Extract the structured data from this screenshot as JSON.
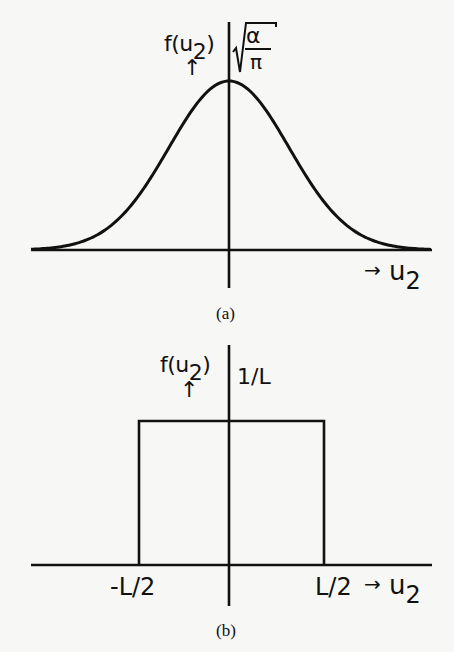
{
  "figure": {
    "panel_a": {
      "caption": "(a)",
      "y_label_fn": "f(u",
      "y_label_sub": "2",
      "y_label_close": ")",
      "y_arrow": "↑",
      "x_label_arrow": "→",
      "x_label_var": "u",
      "x_label_sub": "2",
      "peak_label_num": "α",
      "peak_label_den": "π",
      "peak_label_radical": "√"
    },
    "panel_b": {
      "caption": "(b)",
      "y_label_fn": "f(u",
      "y_label_sub": "2",
      "y_label_close": ")",
      "y_arrow": "↑",
      "x_label_arrow": "→",
      "x_label_var": "u",
      "x_label_sub": "2",
      "height_label": "1/L",
      "left_tick": "-L/2",
      "right_tick": "L/2"
    }
  },
  "chart_data": [
    {
      "type": "line",
      "title": "(a) Gaussian distribution",
      "xlabel": "u2",
      "ylabel": "f(u2)",
      "function": "f(u2) = sqrt(alpha/pi) * exp(-alpha * u2^2)",
      "peak": {
        "x": 0,
        "y_label": "sqrt(alpha/pi)"
      },
      "annotations": [
        "√(α/π)"
      ],
      "x": [
        -3,
        -2.5,
        -2,
        -1.5,
        -1,
        -0.5,
        0,
        0.5,
        1,
        1.5,
        2,
        2.5,
        3
      ],
      "values": [
        0.011,
        0.044,
        0.135,
        0.325,
        0.607,
        0.882,
        1.0,
        0.882,
        0.607,
        0.325,
        0.135,
        0.044,
        0.011
      ],
      "values_note": "normalized to peak = 1 (peak value sqrt(alpha/pi)); x in units of sigma",
      "grid": false,
      "legend": null
    },
    {
      "type": "line",
      "title": "(b) Uniform (rectangular) distribution",
      "xlabel": "u2",
      "ylabel": "f(u2)",
      "function": "f(u2) = 1/L for -L/2 <= u2 <= L/2, else 0",
      "tick_labels_x": [
        "-L/2",
        "L/2"
      ],
      "annotations": [
        "1/L"
      ],
      "x": [
        "-L/2",
        "-L/2",
        "L/2",
        "L/2"
      ],
      "values": [
        0,
        1,
        1,
        0
      ],
      "values_note": "height in units of 1/L",
      "grid": false,
      "legend": null
    }
  ]
}
